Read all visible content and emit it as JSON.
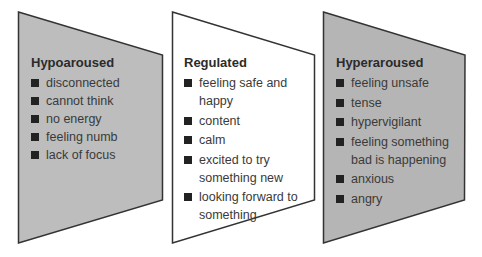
{
  "colors": {
    "hypo_fill": "#bdbdbd",
    "regulated_fill": "#ffffff",
    "hyper_fill": "#b5b5b5",
    "outline": "#333333",
    "bullet": "#222222"
  },
  "panels": [
    {
      "id": "hypoaroused",
      "title": "Hypoaroused",
      "items": [
        "disconnected",
        "cannot think",
        "no energy",
        "feeling numb",
        "lack of focus"
      ]
    },
    {
      "id": "regulated",
      "title": "Regulated",
      "items": [
        "feeling safe and happy",
        "content",
        "calm",
        "excited to try something new",
        "looking forward to something"
      ]
    },
    {
      "id": "hyperaroused",
      "title": "Hyperaroused",
      "items": [
        "feeling unsafe",
        "tense",
        "hypervigilant",
        "feeling something bad is happening",
        "anxious",
        "angry"
      ]
    }
  ]
}
